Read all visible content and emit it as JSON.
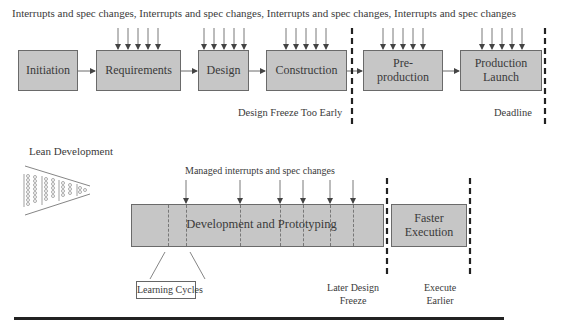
{
  "traditional": {
    "header": "Interrupts and spec changes, Interrupts and spec changes, Interrupts and spec changes, Interrupts and spec changes",
    "phases": [
      {
        "label": "Initiation"
      },
      {
        "label": "Requirements"
      },
      {
        "label": "Design"
      },
      {
        "label": "Construction"
      },
      {
        "label_line1": "Pre-",
        "label_line2": "production"
      },
      {
        "label_line1": "Production",
        "label_line2": "Launch"
      }
    ],
    "milestones": {
      "design_freeze": "Design Freeze Too Early",
      "deadline": "Deadline"
    }
  },
  "lean": {
    "title": "Lean Development",
    "funnel_icon": "funnel-icon",
    "header": "Managed interrupts and spec changes",
    "dev_phase": "Development and Prototyping",
    "exec_phase_line1": "Faster",
    "exec_phase_line2": "Execution",
    "learning_cycles": "Learning Cycles",
    "later_freeze_line1": "Later Design",
    "later_freeze_line2": "Freeze",
    "execute_earlier_line1": "Execute",
    "execute_earlier_line2": "Earlier"
  },
  "colors": {
    "box_fill": "#c6c6c6",
    "box_border": "#6a6a6a",
    "dashed_line": "#222222",
    "rule": "#222222"
  }
}
